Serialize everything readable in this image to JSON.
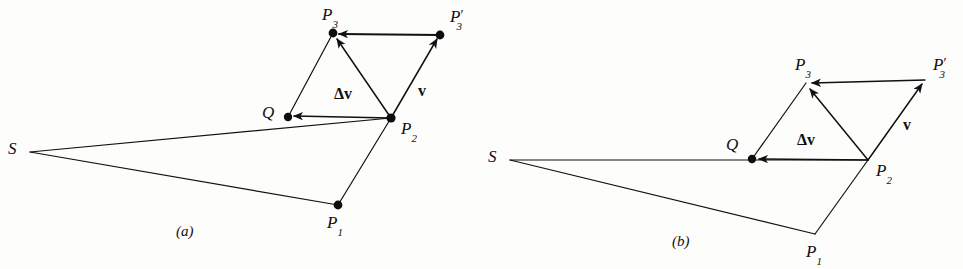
{
  "figure": {
    "ink_color": "#111111",
    "background_color": "#fdfdfc",
    "panels": [
      {
        "id": "a",
        "caption": "(a)",
        "caption_pos": {
          "x": 176,
          "y": 224
        },
        "points": {
          "S": {
            "label": "S",
            "x": 30,
            "y": 152,
            "dot": false,
            "label_pos": {
              "x": 8,
              "y": 140
            }
          },
          "P1": {
            "label": "P",
            "sub": "1",
            "x": 338,
            "y": 205,
            "dot": true,
            "label_pos": {
              "x": 327,
              "y": 214
            }
          },
          "P2": {
            "label": "P",
            "sub": "2",
            "x": 391,
            "y": 118,
            "dot": true,
            "label_pos": {
              "x": 401,
              "y": 120
            }
          },
          "P3": {
            "label": "P",
            "sub": "3",
            "x": 333,
            "y": 33,
            "dot": true,
            "label_pos": {
              "x": 322,
              "y": 6
            }
          },
          "P3p": {
            "label": "P",
            "sub": "3",
            "prime": "′",
            "x": 440,
            "y": 35,
            "dot": true,
            "label_pos": {
              "x": 450,
              "y": 8
            }
          },
          "Q": {
            "label": "Q",
            "x": 288,
            "y": 117,
            "dot": true,
            "label_pos": {
              "x": 262,
              "y": 104
            }
          }
        },
        "vector_labels": [
          {
            "name": "delta-v",
            "text": "Δv",
            "x": 334,
            "y": 86
          },
          {
            "name": "v",
            "text": "v",
            "x": 418,
            "y": 83
          }
        ]
      },
      {
        "id": "b",
        "caption": "(b)",
        "caption_pos": {
          "x": 672,
          "y": 234
        },
        "points": {
          "S": {
            "label": "S",
            "x": 510,
            "y": 160,
            "dot": false,
            "label_pos": {
              "x": 488,
              "y": 148
            }
          },
          "P1": {
            "label": "P",
            "sub": "1",
            "x": 815,
            "y": 234,
            "dot": false,
            "label_pos": {
              "x": 806,
              "y": 243
            }
          },
          "P2": {
            "label": "P",
            "sub": "2",
            "x": 868,
            "y": 160,
            "dot": false,
            "label_pos": {
              "x": 876,
              "y": 162
            }
          },
          "P3": {
            "label": "P",
            "sub": "3",
            "x": 806,
            "y": 83,
            "dot": false,
            "label_pos": {
              "x": 795,
              "y": 56
            }
          },
          "P3p": {
            "label": "P",
            "sub": "3",
            "prime": "′",
            "x": 925,
            "y": 80,
            "dot": false,
            "label_pos": {
              "x": 933,
              "y": 56
            }
          },
          "Q": {
            "label": "Q",
            "x": 752,
            "y": 159,
            "dot": true,
            "label_pos": {
              "x": 726,
              "y": 136
            }
          }
        },
        "vector_labels": [
          {
            "name": "delta-v",
            "text": "Δv",
            "x": 797,
            "y": 132
          },
          {
            "name": "v",
            "text": "v",
            "x": 903,
            "y": 117
          }
        ]
      }
    ],
    "edges_description": [
      "S to P2 radius vector",
      "S to P1 radius vector",
      "P1 to P2 chord",
      "P2 to P3 velocity-after arrow",
      "P2 to P3-prime velocity-before arrow",
      "P3-prime to P3 difference arrow",
      "P2 to Q delta-v arrow",
      "Q to P3 construction line"
    ]
  }
}
